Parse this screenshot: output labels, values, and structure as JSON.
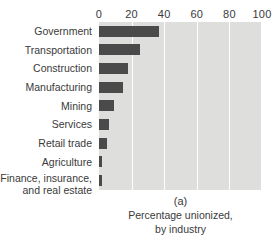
{
  "chart_data": {
    "type": "bar",
    "orientation": "horizontal",
    "title": "",
    "xlabel": "",
    "ylabel": "",
    "xlim": [
      0,
      100
    ],
    "xticks": [
      0,
      20,
      40,
      60,
      80,
      100
    ],
    "xtick_labels": [
      "0",
      "20",
      "40",
      "60",
      "80",
      "100"
    ],
    "grid": true,
    "grid_axis": "x",
    "legend": false,
    "plot_background": "#dededc",
    "bar_color": "#4a4a4a",
    "categories": [
      "Government",
      "Transportation",
      "Construction",
      "Manufacturing",
      "Mining",
      "Services",
      "Retail trade",
      "Agriculture",
      "Finance, insurance, and real estate"
    ],
    "values": [
      37,
      25,
      18,
      15,
      9,
      6,
      5,
      2,
      2
    ],
    "unit": "percent"
  },
  "axis": {
    "x_ticks": [
      {
        "value": 0,
        "label": "0"
      },
      {
        "value": 20,
        "label": "20"
      },
      {
        "value": 40,
        "label": "40"
      },
      {
        "value": 60,
        "label": "60"
      },
      {
        "value": 80,
        "label": "80"
      },
      {
        "value": 100,
        "label": "100"
      }
    ],
    "y_categories": [
      {
        "label": "Government",
        "lines": [
          "Government"
        ]
      },
      {
        "label": "Transportation",
        "lines": [
          "Transportation"
        ]
      },
      {
        "label": "Construction",
        "lines": [
          "Construction"
        ]
      },
      {
        "label": "Manufacturing",
        "lines": [
          "Manufacturing"
        ]
      },
      {
        "label": "Mining",
        "lines": [
          "Mining"
        ]
      },
      {
        "label": "Services",
        "lines": [
          "Services"
        ]
      },
      {
        "label": "Retail trade",
        "lines": [
          "Retail trade"
        ]
      },
      {
        "label": "Agriculture",
        "lines": [
          "Agriculture"
        ]
      },
      {
        "label": "Finance, insurance, and real estate",
        "lines": [
          "Finance, insurance,",
          "and real estate"
        ]
      }
    ]
  },
  "caption": {
    "panel_letter": "(a)",
    "line1": "Percentage unionized,",
    "line2": "by industry"
  },
  "colors": {
    "bar": "#4a4a4a",
    "plot_background": "#dededc",
    "gridline": "#ffffff",
    "text": "#3a3a3a",
    "page_background": "#ffffff"
  }
}
